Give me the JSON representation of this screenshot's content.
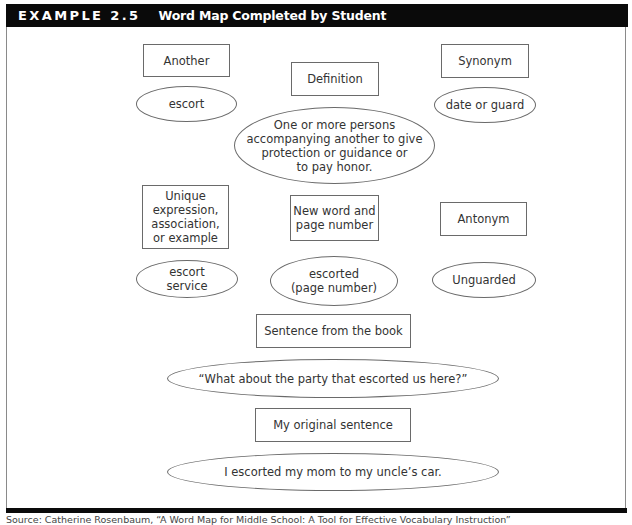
{
  "header": {
    "label": "EXAMPLE 2.5",
    "title": "Word Map Completed by Student"
  },
  "word_map": {
    "another": {
      "label": "Another",
      "value": "escort"
    },
    "definition": {
      "label": "Definition",
      "value": "One or more persons\naccompanying another to give\nprotection or guidance or\nto pay honor."
    },
    "synonym": {
      "label": "Synonym",
      "value": "date or guard"
    },
    "unique": {
      "label": "Unique\nexpression,\nassociation,\nor example",
      "value": "escort\nservice"
    },
    "new_word": {
      "label": "New word and\npage number",
      "value": "escorted\n(page number)"
    },
    "antonym": {
      "label": "Antonym",
      "value": "Unguarded"
    },
    "book_sentence": {
      "label": "Sentence from the book",
      "value": "“What about the party that escorted us here?”"
    },
    "original_sentence": {
      "label": "My original sentence",
      "value": "I escorted my mom to my uncle’s car."
    }
  },
  "footer": {
    "source": "Source: Catherine Rosenbaum, “A Word Map for Middle School: A Tool for Effective Vocabulary Instruction”"
  }
}
